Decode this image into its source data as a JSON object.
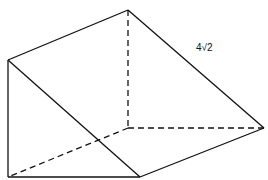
{
  "diagram": {
    "type": "triangular-prism",
    "label": "4√2",
    "colors": {
      "stroke": "#111111",
      "background": "#ffffff"
    }
  }
}
